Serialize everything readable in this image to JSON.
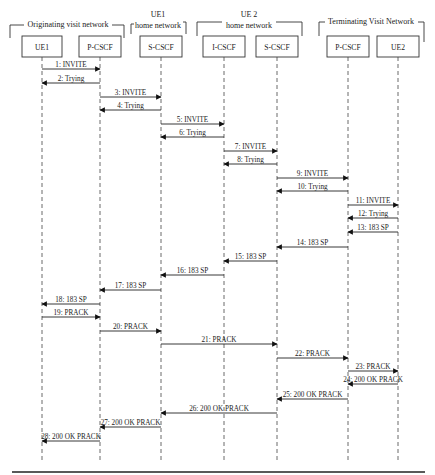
{
  "diagram": {
    "type": "sequence-diagram",
    "groups": [
      {
        "id": "orig",
        "label": "Originating visit network",
        "lines": [
          "Originating visit network"
        ]
      },
      {
        "id": "ue1home",
        "label": "UE1 home network",
        "lines": [
          "UE1",
          "home network"
        ]
      },
      {
        "id": "ue2home",
        "label": "UE 2 home network",
        "lines": [
          "UE 2",
          "home network"
        ]
      },
      {
        "id": "term",
        "label": "Terminating Visit Network",
        "lines": [
          "Terminating Visit Network"
        ]
      }
    ],
    "participants": [
      {
        "id": "ue1",
        "label": "UE1",
        "x": 45
      },
      {
        "id": "pcscf_o",
        "label": "P-CSCF",
        "x": 103
      },
      {
        "id": "scscf_o",
        "label": "S-CSCF",
        "x": 164
      },
      {
        "id": "icscf",
        "label": "I-CSCF",
        "x": 228
      },
      {
        "id": "scscf_t",
        "label": "S-CSCF",
        "x": 280
      },
      {
        "id": "pcscf_t",
        "label": "P-CSCF",
        "x": 352
      },
      {
        "id": "ue2",
        "label": "UE2",
        "x": 402
      }
    ],
    "messages": [
      {
        "n": 1,
        "label": "1: INVITE",
        "from": 0,
        "to": 1,
        "y": 69
      },
      {
        "n": 2,
        "label": "2: Trying",
        "from": 1,
        "to": 0,
        "y": 83
      },
      {
        "n": 3,
        "label": "3: INVITE",
        "from": 1,
        "to": 2,
        "y": 97
      },
      {
        "n": 4,
        "label": "4: Trying",
        "from": 2,
        "to": 1,
        "y": 110
      },
      {
        "n": 5,
        "label": "5: INVITE",
        "from": 2,
        "to": 3,
        "y": 124
      },
      {
        "n": 6,
        "label": "6: Trying",
        "from": 3,
        "to": 2,
        "y": 137
      },
      {
        "n": 7,
        "label": "7: INVITE",
        "from": 3,
        "to": 4,
        "y": 151
      },
      {
        "n": 8,
        "label": "8: Trying",
        "from": 4,
        "to": 3,
        "y": 164
      },
      {
        "n": 9,
        "label": "9: INVITE",
        "from": 4,
        "to": 5,
        "y": 178
      },
      {
        "n": 10,
        "label": "10: Trying",
        "from": 5,
        "to": 4,
        "y": 191
      },
      {
        "n": 11,
        "label": "11: INVITE",
        "from": 5,
        "to": 6,
        "y": 205
      },
      {
        "n": 12,
        "label": "12: Trying",
        "from": 6,
        "to": 5,
        "y": 218
      },
      {
        "n": 13,
        "label": "13: 183 SP",
        "from": 6,
        "to": 5,
        "y": 232
      },
      {
        "n": 14,
        "label": "14: 183 SP",
        "from": 5,
        "to": 4,
        "y": 247
      },
      {
        "n": 15,
        "label": "15: 183 SP",
        "from": 4,
        "to": 3,
        "y": 261
      },
      {
        "n": 16,
        "label": "16: 183 SP",
        "from": 3,
        "to": 2,
        "y": 275
      },
      {
        "n": 17,
        "label": "17: 183 SP",
        "from": 2,
        "to": 1,
        "y": 290
      },
      {
        "n": 18,
        "label": "18: 183 SP",
        "from": 1,
        "to": 0,
        "y": 304
      },
      {
        "n": 19,
        "label": "19: PRACK",
        "from": 0,
        "to": 1,
        "y": 317
      },
      {
        "n": 20,
        "label": "20: PRACK",
        "from": 1,
        "to": 2,
        "y": 331
      },
      {
        "n": 21,
        "label": "21: PRACK",
        "from": 2,
        "to": 4,
        "y": 344
      },
      {
        "n": 22,
        "label": "22: PRACK",
        "from": 4,
        "to": 5,
        "y": 358
      },
      {
        "n": 23,
        "label": "23: PRACK",
        "from": 5,
        "to": 6,
        "y": 371
      },
      {
        "n": 24,
        "label": "24: 200 OK PRACK",
        "from": 6,
        "to": 5,
        "y": 384
      },
      {
        "n": 25,
        "label": "25: 200 OK PRACK",
        "from": 5,
        "to": 4,
        "y": 399
      },
      {
        "n": 26,
        "label": "26: 200 OK PRACK",
        "from": 4,
        "to": 2,
        "y": 413
      },
      {
        "n": 27,
        "label": "27: 200 OK PRACK",
        "from": 2,
        "to": 1,
        "y": 427
      },
      {
        "n": 28,
        "label": "28: 200 OK PRACK",
        "from": 1,
        "to": 0,
        "y": 441
      }
    ]
  }
}
